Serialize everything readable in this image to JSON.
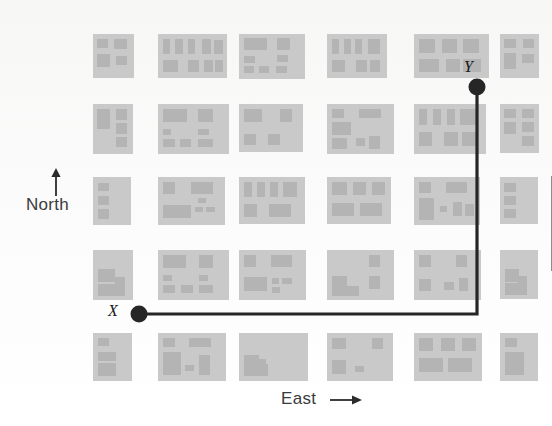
{
  "figure": {
    "background_color": "#fbfbfa",
    "block_color": "#c9c9c9",
    "building_color": "#b4b4b4",
    "route_color": "#262626"
  },
  "compass": {
    "north_label": "North",
    "north_arrow": "up-arrow-icon",
    "east_label": "East",
    "east_arrow": "right-arrow-icon"
  },
  "points": [
    {
      "id": "X",
      "label": "X",
      "x": 139,
      "y": 314
    },
    {
      "id": "Y",
      "label": "Y",
      "x": 477,
      "y": 87
    }
  ],
  "route": {
    "name": "x-to-y-route",
    "description": "East then North",
    "segments": [
      {
        "from": "X",
        "to": "corner",
        "direction": "east",
        "x1": 139,
        "y1": 314,
        "x2": 477,
        "y2": 314
      },
      {
        "from": "corner",
        "to": "Y",
        "direction": "north",
        "x1": 477,
        "y1": 314,
        "x2": 477,
        "y2": 87
      }
    ],
    "corner": {
      "x": 477,
      "y": 314
    }
  },
  "grid": {
    "rows": 5,
    "cols": 6,
    "row_y": [
      34,
      104,
      177,
      250,
      333
    ],
    "col_x": [
      93,
      158,
      239,
      327,
      414,
      500
    ],
    "blocks": [
      [
        {
          "w": 41,
          "h": 44,
          "bldgs": [
            [
              4,
              5,
              11,
              9
            ],
            [
              21,
              5,
              13,
              10
            ],
            [
              4,
              20,
              13,
              13
            ],
            [
              23,
              22,
              11,
              9
            ]
          ]
        },
        {
          "w": 69,
          "h": 44,
          "bldgs": [
            [
              5,
              5,
              7,
              15
            ],
            [
              17,
              5,
              8,
              15
            ],
            [
              30,
              5,
              7,
              15
            ],
            [
              44,
              5,
              9,
              15
            ],
            [
              56,
              6,
              9,
              14
            ],
            [
              5,
              26,
              15,
              12
            ],
            [
              30,
              26,
              11,
              12
            ],
            [
              46,
              26,
              9,
              12
            ],
            [
              57,
              26,
              8,
              12
            ]
          ]
        },
        {
          "w": 66,
          "h": 45,
          "bldgs": [
            [
              5,
              4,
              23,
              12
            ],
            [
              38,
              4,
              13,
              12
            ],
            [
              5,
              22,
              11,
              7
            ],
            [
              38,
              21,
              11,
              7
            ],
            [
              5,
              32,
              10,
              7
            ],
            [
              20,
              32,
              10,
              7
            ],
            [
              37,
              32,
              11,
              7
            ]
          ]
        },
        {
          "w": 60,
          "h": 44,
          "bldgs": [
            [
              5,
              5,
              7,
              15
            ],
            [
              17,
              5,
              7,
              15
            ],
            [
              28,
              5,
              7,
              15
            ],
            [
              41,
              5,
              12,
              15
            ],
            [
              5,
              26,
              13,
              12
            ],
            [
              29,
              26,
              11,
              12
            ],
            [
              43,
              26,
              10,
              12
            ]
          ]
        },
        {
          "w": 75,
          "h": 44,
          "bldgs": [
            [
              5,
              5,
              16,
              14
            ],
            [
              28,
              5,
              15,
              14
            ],
            [
              49,
              5,
              16,
              14
            ],
            [
              5,
              25,
              20,
              13
            ],
            [
              32,
              25,
              14,
              13
            ],
            [
              49,
              25,
              18,
              13
            ]
          ]
        },
        {
          "w": 39,
          "h": 44,
          "bldgs": [
            [
              4,
              5,
              12,
              9
            ],
            [
              23,
              5,
              11,
              9
            ],
            [
              4,
              19,
              12,
              16
            ],
            [
              22,
              20,
              12,
              9
            ]
          ]
        }
      ],
      [
        {
          "w": 40,
          "h": 50,
          "bldgs": [
            [
              4,
              5,
              13,
              20
            ],
            [
              23,
              5,
              11,
              11
            ],
            [
              23,
              19,
              11,
              11
            ],
            [
              23,
              33,
              11,
              10
            ]
          ]
        },
        {
          "w": 71,
          "h": 50,
          "bldgs": [
            [
              5,
              5,
              24,
              13
            ],
            [
              40,
              5,
              15,
              13
            ],
            [
              5,
              25,
              8,
              6
            ],
            [
              40,
              25,
              11,
              6
            ],
            [
              5,
              35,
              12,
              8
            ],
            [
              22,
              35,
              11,
              8
            ],
            [
              40,
              35,
              15,
              8
            ]
          ]
        },
        {
          "w": 64,
          "h": 48,
          "bldgs": [
            [
              5,
              5,
              18,
              13
            ],
            [
              41,
              5,
              12,
              13
            ],
            [
              5,
              30,
              12,
              11
            ],
            [
              29,
              30,
              12,
              11
            ]
          ]
        },
        {
          "w": 67,
          "h": 50,
          "bldgs": [
            [
              5,
              5,
              12,
              9
            ],
            [
              32,
              5,
              22,
              9
            ],
            [
              5,
              18,
              19,
              13
            ],
            [
              5,
              34,
              15,
              11
            ],
            [
              29,
              34,
              9,
              8
            ],
            [
              42,
              32,
              11,
              13
            ]
          ]
        },
        {
          "w": 72,
          "h": 50,
          "bldgs": [
            [
              5,
              5,
              8,
              16
            ],
            [
              19,
              5,
              8,
              16
            ],
            [
              33,
              5,
              8,
              16
            ],
            [
              46,
              5,
              18,
              16
            ],
            [
              5,
              28,
              13,
              14
            ],
            [
              30,
              28,
              14,
              14
            ],
            [
              48,
              28,
              16,
              14
            ]
          ]
        },
        {
          "w": 39,
          "h": 49,
          "bldgs": [
            [
              4,
              5,
              12,
              9
            ],
            [
              22,
              5,
              12,
              9
            ],
            [
              4,
              18,
              12,
              12
            ],
            [
              22,
              18,
              12,
              10
            ],
            [
              22,
              32,
              12,
              10
            ]
          ]
        }
      ],
      [
        {
          "w": 38,
          "h": 48,
          "bldgs": [
            [
              5,
              6,
              11,
              8
            ],
            [
              5,
              19,
              11,
              9
            ],
            [
              5,
              32,
              11,
              10
            ]
          ]
        },
        {
          "w": 67,
          "h": 48,
          "bldgs": [
            [
              5,
              5,
              12,
              12
            ],
            [
              33,
              5,
              22,
              12
            ],
            [
              40,
              21,
              8,
              5
            ],
            [
              5,
              28,
              28,
              13
            ],
            [
              37,
              30,
              8,
              5
            ],
            [
              48,
              30,
              9,
              5
            ]
          ]
        },
        {
          "w": 66,
          "h": 47,
          "bldgs": [
            [
              5,
              5,
              8,
              15
            ],
            [
              18,
              5,
              8,
              15
            ],
            [
              31,
              5,
              8,
              15
            ],
            [
              44,
              5,
              14,
              15
            ],
            [
              5,
              27,
              13,
              13
            ],
            [
              30,
              27,
              22,
              13
            ]
          ]
        },
        {
          "w": 64,
          "h": 47,
          "bldgs": [
            [
              5,
              5,
              15,
              13
            ],
            [
              26,
              5,
              13,
              13
            ],
            [
              45,
              5,
              13,
              13
            ],
            [
              5,
              26,
              22,
              13
            ],
            [
              33,
              26,
              22,
              13
            ]
          ]
        },
        {
          "w": 66,
          "h": 48,
          "bldgs": [
            [
              5,
              5,
              12,
              11
            ],
            [
              32,
              5,
              21,
              11
            ],
            [
              5,
              21,
              15,
              22
            ],
            [
              26,
              29,
              7,
              6
            ],
            [
              39,
              25,
              9,
              14
            ],
            [
              51,
              27,
              9,
              12
            ]
          ]
        },
        {
          "w": 38,
          "h": 47,
          "bldgs": [
            [
              4,
              6,
              12,
              9
            ],
            [
              4,
              19,
              12,
              9
            ],
            [
              4,
              32,
              12,
              9
            ]
          ]
        }
      ],
      [
        {
          "w": 40,
          "h": 50,
          "bldgs": [
            [
              5,
              19,
              17,
              13
            ],
            [
              5,
              34,
              24,
              12
            ],
            [
              22,
              27,
              10,
              19
            ]
          ]
        },
        {
          "w": 71,
          "h": 50,
          "bldgs": [
            [
              5,
              5,
              23,
              13
            ],
            [
              41,
              5,
              14,
              13
            ],
            [
              5,
              25,
              9,
              6
            ],
            [
              41,
              25,
              9,
              6
            ],
            [
              5,
              35,
              12,
              8
            ],
            [
              23,
              35,
              12,
              8
            ],
            [
              41,
              35,
              14,
              8
            ]
          ]
        },
        {
          "w": 67,
          "h": 50,
          "bldgs": [
            [
              5,
              5,
              12,
              12
            ],
            [
              32,
              5,
              21,
              12
            ],
            [
              5,
              27,
              23,
              14
            ],
            [
              33,
              28,
              7,
              6
            ],
            [
              43,
              28,
              10,
              6
            ],
            [
              33,
              37,
              8,
              6
            ]
          ]
        },
        {
          "w": 67,
          "h": 50,
          "bldgs": [
            [
              42,
              5,
              11,
              12
            ],
            [
              5,
              26,
              15,
              12
            ],
            [
              5,
              36,
              27,
              10
            ],
            [
              42,
              26,
              11,
              13
            ]
          ]
        },
        {
          "w": 67,
          "h": 50,
          "bldgs": [
            [
              5,
              5,
              12,
              12
            ],
            [
              42,
              5,
              11,
              12
            ],
            [
              5,
              29,
              12,
              12
            ],
            [
              30,
              32,
              10,
              8
            ],
            [
              45,
              28,
              9,
              13
            ]
          ]
        },
        {
          "w": 38,
          "h": 49,
          "bldgs": [
            [
              5,
              19,
              14,
              13
            ],
            [
              5,
              33,
              20,
              12
            ],
            [
              18,
              26,
              9,
              19
            ]
          ]
        }
      ],
      [
        {
          "w": 39,
          "h": 48,
          "bldgs": [
            [
              5,
              5,
              11,
              8
            ],
            [
              5,
              19,
              18,
              9
            ],
            [
              5,
              30,
              18,
              13
            ]
          ]
        },
        {
          "w": 68,
          "h": 48,
          "bldgs": [
            [
              5,
              5,
              12,
              9
            ],
            [
              31,
              5,
              22,
              9
            ],
            [
              5,
              19,
              18,
              23
            ],
            [
              27,
              32,
              9,
              6
            ],
            [
              41,
              22,
              11,
              20
            ]
          ]
        },
        {
          "w": 69,
          "h": 48,
          "bldgs": [
            [
              5,
              22,
              15,
              12
            ],
            [
              5,
              31,
              24,
              12
            ],
            [
              18,
              26,
              9,
              17
            ]
          ]
        },
        {
          "w": 66,
          "h": 48,
          "bldgs": [
            [
              5,
              5,
              14,
              11
            ],
            [
              45,
              5,
              11,
              11
            ],
            [
              5,
              27,
              14,
              14
            ],
            [
              28,
              33,
              9,
              6
            ]
          ]
        },
        {
          "w": 68,
          "h": 48,
          "bldgs": [
            [
              5,
              5,
              14,
              13
            ],
            [
              27,
              5,
              14,
              13
            ],
            [
              48,
              5,
              14,
              13
            ],
            [
              5,
              25,
              24,
              14
            ],
            [
              34,
              25,
              24,
              14
            ]
          ]
        },
        {
          "w": 38,
          "h": 48,
          "bldgs": [
            [
              5,
              5,
              12,
              9
            ],
            [
              5,
              19,
              19,
              23
            ]
          ]
        }
      ]
    ]
  }
}
